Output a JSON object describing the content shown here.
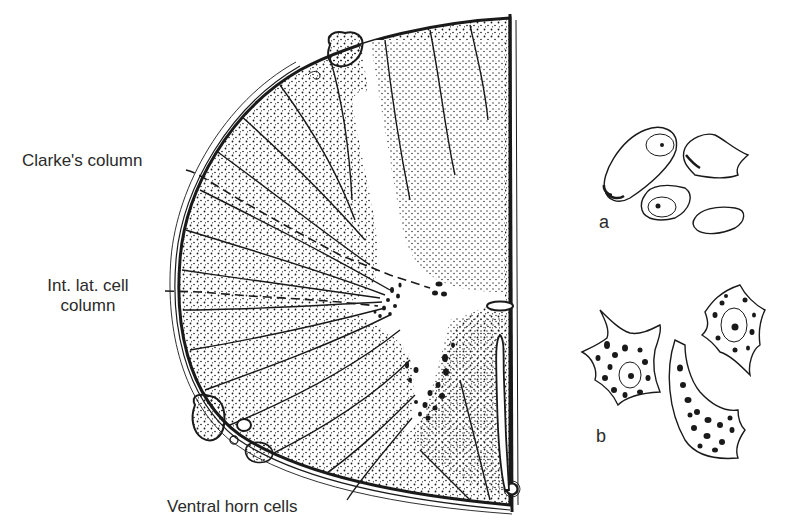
{
  "figure": {
    "labels": {
      "clarkes_column": "Clarke's column",
      "int_lat_line1": "Int. lat. cell",
      "int_lat_line2": "column",
      "ventral_horn": "Ventral horn cells"
    },
    "panels": {
      "a": "a",
      "b": "b"
    },
    "colors": {
      "ink": "#1a1a1a",
      "text": "#2a2a2a",
      "background": "#ffffff"
    }
  }
}
